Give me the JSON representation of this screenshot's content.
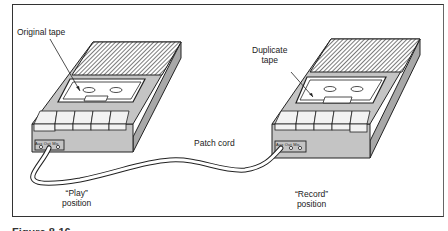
{
  "figure": {
    "labels": {
      "original_tape": "Original tape",
      "duplicate_tape_line1": "Duplicate",
      "duplicate_tape_line2": "tape",
      "patch_cord": "Patch cord",
      "play_line1": "“Play”",
      "play_line2": "position",
      "record_line1": "“Record”",
      "record_line2": "position"
    },
    "left_recorder": {
      "jacks": [
        "Aux",
        "Out",
        "Mic"
      ]
    },
    "right_recorder": {
      "jacks": [
        "Aux",
        "Out",
        "Mic"
      ]
    },
    "caption_partial": "Figure 8-16 ..."
  },
  "colors": {
    "body_gray": "#c4c4c4",
    "side_gray": "#a8a8a8",
    "outline": "#222222",
    "key_white": "#f2f2f2"
  }
}
